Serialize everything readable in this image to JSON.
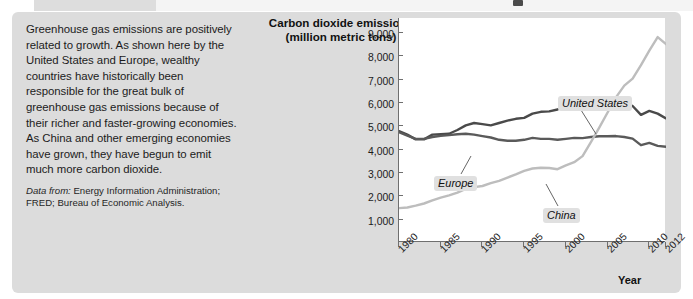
{
  "figure": {
    "panel_bg": "#dcdcdc",
    "text_paragraph": "Greenhouse gas emissions are positively related to growth. As shown here by the United States and Europe, wealthy countries have historically been responsible for the great bulk of greenhouse gas emissions because of their richer and faster-growing economies. As China and other emerging economies have grown, they have begun to emit much more carbon dioxide.",
    "source_label": "Data from:",
    "source_text": "Energy Information Administration; FRED; Bureau of Economic Analysis."
  },
  "chart_data": {
    "type": "line",
    "title": "Carbon dioxide emissions\n(million metric tons)",
    "title_line1": "Carbon dioxide emissions",
    "title_line2": "(million metric tons)",
    "xlabel": "Year",
    "ylabel": "Carbon dioxide emissions (million metric tons)",
    "grid": false,
    "legend": "inline-callouts",
    "xlim": [
      1980,
      2012
    ],
    "ylim": [
      0,
      9600
    ],
    "yticks": [
      9000,
      8000,
      7000,
      6000,
      5000,
      4000,
      3000,
      2000,
      1000
    ],
    "ytick_labels": [
      "9,000",
      "8,000",
      "7,000",
      "6,000",
      "5,000",
      "4,000",
      "3,000",
      "2,000",
      "1,000"
    ],
    "xticks": [
      1980,
      1985,
      1990,
      1995,
      2000,
      2005,
      2010,
      2012
    ],
    "xtick_labels": [
      "1980",
      "1985",
      "1990",
      "1995",
      "2000",
      "2005",
      "2010",
      "2012"
    ],
    "x": [
      1980,
      1981,
      1982,
      1983,
      1984,
      1985,
      1986,
      1987,
      1988,
      1989,
      1990,
      1991,
      1992,
      1993,
      1994,
      1995,
      1996,
      1997,
      1998,
      1999,
      2000,
      2001,
      2002,
      2003,
      2004,
      2005,
      2006,
      2007,
      2008,
      2009,
      2010,
      2011,
      2012
    ],
    "series": [
      {
        "name": "United States",
        "color": "#4a4a4a",
        "values": [
          4750,
          4600,
          4400,
          4400,
          4600,
          4620,
          4640,
          4800,
          5000,
          5100,
          5050,
          5000,
          5100,
          5200,
          5280,
          5320,
          5500,
          5580,
          5600,
          5680,
          5850,
          5730,
          5780,
          5820,
          5920,
          5990,
          5930,
          6000,
          5830,
          5450,
          5620,
          5500,
          5300
        ]
      },
      {
        "name": "Europe",
        "color": "#5a5a5a",
        "values": [
          4700,
          4560,
          4420,
          4420,
          4500,
          4550,
          4580,
          4620,
          4640,
          4600,
          4540,
          4480,
          4380,
          4340,
          4340,
          4380,
          4460,
          4420,
          4420,
          4380,
          4420,
          4460,
          4450,
          4500,
          4530,
          4530,
          4540,
          4500,
          4430,
          4150,
          4250,
          4120,
          4080
        ]
      },
      {
        "name": "China",
        "color": "#bdbdbd",
        "values": [
          1450,
          1480,
          1560,
          1650,
          1780,
          1900,
          2000,
          2120,
          2280,
          2350,
          2400,
          2520,
          2620,
          2760,
          2900,
          3050,
          3150,
          3180,
          3170,
          3120,
          3280,
          3420,
          3680,
          4280,
          4900,
          5550,
          6200,
          6700,
          7000,
          7580,
          8200,
          8780,
          8480
        ]
      }
    ],
    "annotations": [
      {
        "text": "United States",
        "series": "United States"
      },
      {
        "text": "Europe",
        "series": "Europe"
      },
      {
        "text": "China",
        "series": "China"
      }
    ]
  }
}
